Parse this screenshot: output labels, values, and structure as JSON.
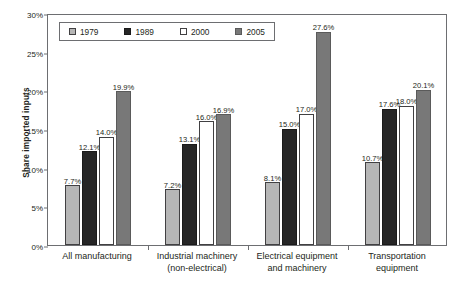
{
  "chart_data": {
    "type": "bar",
    "title": "",
    "xlabel": "",
    "ylabel": "Share imported inputs",
    "ylim": [
      0,
      30
    ],
    "ytick_labels": [
      "0%",
      "5%",
      "10%",
      "15%",
      "20%",
      "25%",
      "30%"
    ],
    "ytick_values": [
      0,
      5,
      10,
      15,
      20,
      25,
      30
    ],
    "grid": false,
    "legend_position": "top-left",
    "value_suffix": "%",
    "categories": [
      "All manufacturing",
      "Industrial machinery (non-electrical)",
      "Electrical equipment and machinery",
      "Transportation equipment"
    ],
    "category_lines": [
      [
        "All manufacturing"
      ],
      [
        "Industrial machinery",
        "(non-electrical)"
      ],
      [
        "Electrical equipment",
        "and machinery"
      ],
      [
        "Transportation",
        "equipment"
      ]
    ],
    "series": [
      {
        "name": "1979",
        "color": "#b6b6b6",
        "values": [
          7.7,
          7.2,
          8.1,
          10.7
        ],
        "labels": [
          "7.7%",
          "7.2%",
          "8.1%",
          "10.7%"
        ]
      },
      {
        "name": "1989",
        "color": "#262626",
        "values": [
          12.1,
          13.1,
          15.0,
          17.6
        ],
        "labels": [
          "12.1%",
          "13.1%",
          "15.0%",
          "17.6%"
        ]
      },
      {
        "name": "2000",
        "color": "#ffffff",
        "values": [
          14.0,
          16.0,
          17.0,
          18.0
        ],
        "labels": [
          "14.0%",
          "16.0%",
          "17.0%",
          "18.0%"
        ]
      },
      {
        "name": "2005",
        "color": "#787878",
        "values": [
          19.9,
          16.9,
          27.6,
          20.1
        ],
        "labels": [
          "19.9%",
          "16.9%",
          "27.6%",
          "20.1%"
        ]
      }
    ]
  },
  "legend": {
    "items": [
      {
        "label": "1979",
        "key": "s1979"
      },
      {
        "label": "1989",
        "key": "s1989"
      },
      {
        "label": "2000",
        "key": "s2000"
      },
      {
        "label": "2005",
        "key": "s2005"
      }
    ]
  }
}
